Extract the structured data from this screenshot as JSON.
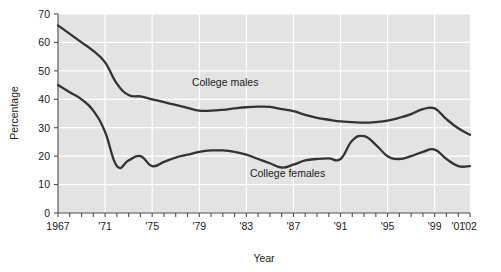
{
  "chart_data": {
    "type": "line",
    "title": "",
    "xlabel": "Year",
    "ylabel": "Percentage",
    "xlim": [
      1967,
      2002
    ],
    "ylim": [
      0,
      70
    ],
    "grid": true,
    "legend_position": "inline-annotation",
    "x": [
      1967,
      1968,
      1969,
      1970,
      1971,
      1972,
      1973,
      1974,
      1975,
      1976,
      1977,
      1978,
      1979,
      1980,
      1981,
      1982,
      1983,
      1984,
      1985,
      1986,
      1987,
      1988,
      1989,
      1990,
      1991,
      1992,
      1993,
      1994,
      1995,
      1996,
      1997,
      1998,
      1999,
      2000,
      2001,
      2002
    ],
    "xtick_values": [
      1967,
      1971,
      1975,
      1979,
      1983,
      1987,
      1991,
      1995,
      1999,
      2001,
      2002
    ],
    "xtick_labels": [
      "1967",
      "'71",
      "'75",
      "'79",
      "'83",
      "'87",
      "'91",
      "'95",
      "'99",
      "'01",
      "'02"
    ],
    "ytick_values": [
      0,
      10,
      20,
      30,
      40,
      50,
      60,
      70
    ],
    "ytick_labels": [
      "0",
      "10",
      "20",
      "30",
      "40",
      "50",
      "60",
      "70"
    ],
    "series": [
      {
        "name": "College males",
        "label": "College males",
        "color": "#333333",
        "label_x": 1981.2,
        "label_y": 44.5,
        "values": [
          66.0,
          63.0,
          60.0,
          57.0,
          53.0,
          45.5,
          41.5,
          41.0,
          40.0,
          39.0,
          38.0,
          37.0,
          36.0,
          36.0,
          36.3,
          36.8,
          37.2,
          37.4,
          37.3,
          36.5,
          35.8,
          34.5,
          33.5,
          32.8,
          32.2,
          32.0,
          31.8,
          32.0,
          32.5,
          33.5,
          34.8,
          36.5,
          36.8,
          33.0,
          29.8,
          27.5
        ]
      },
      {
        "name": "College females",
        "label": "College females",
        "color": "#333333",
        "label_x": 1986.5,
        "label_y": 12.5,
        "values": [
          45.0,
          42.5,
          40.0,
          36.0,
          28.5,
          16.5,
          18.5,
          20.0,
          16.5,
          18.0,
          19.5,
          20.5,
          21.5,
          22.0,
          22.0,
          21.5,
          20.5,
          19.0,
          17.5,
          16.0,
          17.0,
          18.5,
          19.0,
          19.2,
          19.0,
          25.5,
          27.0,
          24.0,
          20.0,
          19.0,
          20.0,
          21.5,
          22.3,
          19.0,
          16.5,
          16.5
        ]
      }
    ],
    "colors": {
      "plot_background": "#e3e3e3",
      "page_background": "#ffffff",
      "gridline": "#ffffff",
      "axis": "#4d4d4d",
      "line": "#333333",
      "text": "#1a1a1a"
    }
  }
}
